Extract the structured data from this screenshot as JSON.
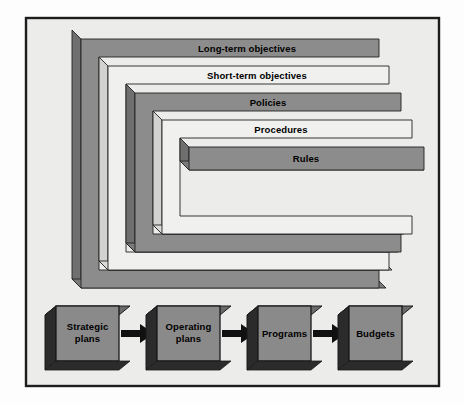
{
  "figure": {
    "background_color": "#ececea",
    "frame_border_color": "#1d1d1d",
    "palette": {
      "gray_face": "#8c8c8c",
      "gray_side": "#6f6f6f",
      "gray_bottom": "#7a7a7a",
      "white_face": "#f0f0ee",
      "white_side": "#d2d2d0",
      "outline": "#222222",
      "cube_front": "#8a8a8a",
      "cube_side": "#2b2b2b",
      "cube_top": "#6a6a6a",
      "arrow": "#111111",
      "label_text": "#000000"
    },
    "layers": [
      {
        "id": "long-term-objectives",
        "label": "Long-term objectives",
        "fill": "gray",
        "depth_index": 0
      },
      {
        "id": "short-term-objectives",
        "label": "Short-term objectives",
        "fill": "white",
        "depth_index": 1
      },
      {
        "id": "policies",
        "label": "Policies",
        "fill": "gray",
        "depth_index": 2
      },
      {
        "id": "procedures",
        "label": "Procedures",
        "fill": "white",
        "depth_index": 3
      },
      {
        "id": "rules",
        "label": "Rules",
        "fill": "gray",
        "depth_index": 4
      }
    ],
    "flow": {
      "nodes": [
        {
          "id": "strategic-plans",
          "label_line1": "Strategic",
          "label_line2": "plans"
        },
        {
          "id": "operating-plans",
          "label_line1": "Operating",
          "label_line2": "plans"
        },
        {
          "id": "programs",
          "label_line1": "Programs",
          "label_line2": ""
        },
        {
          "id": "budgets",
          "label_line1": "Budgets",
          "label_line2": ""
        }
      ],
      "connector_count": 3,
      "connector_shape": "right-arrow"
    }
  }
}
